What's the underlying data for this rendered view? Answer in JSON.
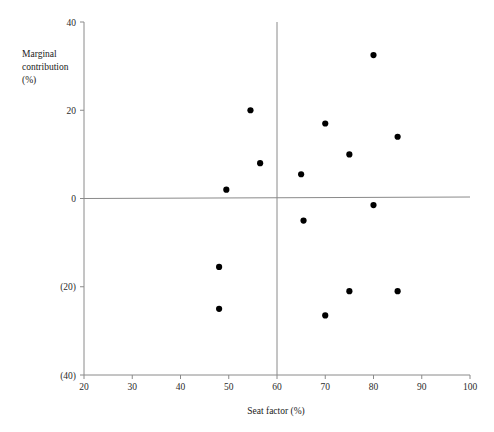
{
  "chart_data": {
    "type": "scatter",
    "title": "",
    "xlabel": "Seat factor (%)",
    "ylabel": "Marginal contribution (%)",
    "ylabel_lines": [
      "Marginal",
      "contribution",
      "(%)"
    ],
    "xlim": [
      20,
      100
    ],
    "ylim": [
      -40,
      40
    ],
    "xticks": [
      20,
      30,
      40,
      50,
      60,
      70,
      80,
      90,
      100
    ],
    "xtick_labels": [
      "20",
      "30",
      "40",
      "50",
      "60",
      "70",
      "80",
      "90",
      "100"
    ],
    "yticks": [
      40,
      20,
      0,
      -20,
      -40
    ],
    "ytick_labels": [
      "40",
      "20",
      "0",
      "(20)",
      "(40)"
    ],
    "grid": false,
    "legend": null,
    "reference_lines": [
      {
        "orientation": "vertical",
        "value": 60,
        "color": "#8a8a8a"
      },
      {
        "orientation": "horizontal",
        "value": 0,
        "color": "#8a8a8a"
      }
    ],
    "marker": {
      "shape": "circle",
      "color": "#000000",
      "size": 3.1
    },
    "points": [
      {
        "x": 80.0,
        "y": 32.5
      },
      {
        "x": 54.5,
        "y": 20.0
      },
      {
        "x": 70.0,
        "y": 17.0
      },
      {
        "x": 85.0,
        "y": 14.0
      },
      {
        "x": 75.0,
        "y": 10.0
      },
      {
        "x": 56.5,
        "y": 8.0
      },
      {
        "x": 65.0,
        "y": 5.5
      },
      {
        "x": 49.5,
        "y": 2.0
      },
      {
        "x": 80.0,
        "y": -1.5
      },
      {
        "x": 65.5,
        "y": -5.0
      },
      {
        "x": 48.0,
        "y": -15.5
      },
      {
        "x": 75.0,
        "y": -21.0
      },
      {
        "x": 85.0,
        "y": -21.0
      },
      {
        "x": 48.0,
        "y": -25.0
      },
      {
        "x": 70.0,
        "y": -26.5
      }
    ]
  },
  "colors": {
    "background": "#ffffff",
    "axis": "#8a8a8a",
    "marker": "#000000",
    "text": "#1a1a1a"
  }
}
